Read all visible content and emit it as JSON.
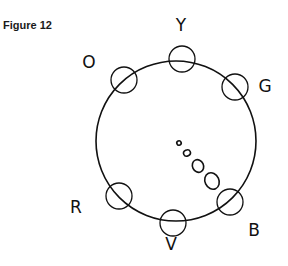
{
  "figure": {
    "title": "Figure 12",
    "main_circle": {
      "cx": 176,
      "cy": 141,
      "r": 80
    },
    "markers": [
      {
        "id": "Y",
        "label": "Y",
        "cx": 182,
        "cy": 59,
        "r": 13,
        "lx": 181,
        "ly": 31
      },
      {
        "id": "G",
        "label": "G",
        "cx": 235,
        "cy": 87,
        "r": 13,
        "lx": 265,
        "ly": 92
      },
      {
        "id": "O",
        "label": "O",
        "cx": 124,
        "cy": 80,
        "r": 13,
        "lx": 89,
        "ly": 68
      },
      {
        "id": "R",
        "label": "R",
        "cx": 119,
        "cy": 196,
        "r": 13,
        "lx": 76,
        "ly": 213
      },
      {
        "id": "V",
        "label": "V",
        "cx": 173,
        "cy": 223,
        "r": 13,
        "lx": 171,
        "ly": 250
      },
      {
        "id": "B",
        "label": "B",
        "cx": 230,
        "cy": 202,
        "r": 13,
        "lx": 254,
        "ly": 236
      }
    ],
    "trail": [
      {
        "cx": 179,
        "cy": 143,
        "rx": 2.2,
        "ry": 2.2
      },
      {
        "cx": 187,
        "cy": 153,
        "rx": 3.5,
        "ry": 3
      },
      {
        "cx": 198,
        "cy": 166,
        "rx": 5.5,
        "ry": 6.5
      },
      {
        "cx": 212,
        "cy": 181,
        "rx": 7,
        "ry": 8.5
      }
    ],
    "colors": {
      "stroke": "#111111",
      "background": "#ffffff"
    }
  }
}
